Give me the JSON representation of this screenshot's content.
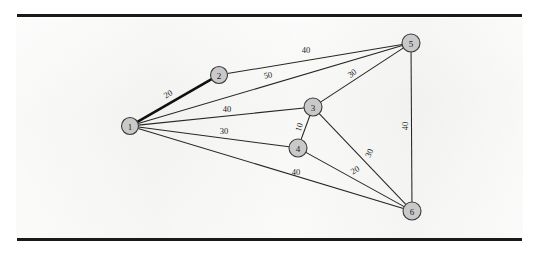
{
  "page": {
    "background_color": "#ffffff",
    "paper_color": "#f2f2f0",
    "rule_color": "#1a1a1a",
    "top_rule_label": "top-horizontal-rule",
    "bottom_rule_label": "bottom-horizontal-rule"
  },
  "figure": {
    "type": "weighted-undirected-graph",
    "node_fill": "#c9c9c9",
    "node_stroke": "#3a3a3a",
    "edge_color": "#262626",
    "highlight_edge_color": "#101010"
  },
  "chart_data": {
    "type": "diagram",
    "title": "",
    "nodes": [
      {
        "id": "1",
        "label": "1",
        "x": 130,
        "y": 126,
        "r": 8.5
      },
      {
        "id": "2",
        "label": "2",
        "x": 219,
        "y": 75,
        "r": 8.5
      },
      {
        "id": "3",
        "label": "3",
        "x": 313,
        "y": 107,
        "r": 9.0
      },
      {
        "id": "4",
        "label": "4",
        "x": 298,
        "y": 148,
        "r": 9.0
      },
      {
        "id": "5",
        "label": "5",
        "x": 411,
        "y": 43,
        "r": 9.0
      },
      {
        "id": "6",
        "label": "6",
        "x": 412,
        "y": 211,
        "r": 9.0
      }
    ],
    "edges": [
      {
        "from": "1",
        "to": "2",
        "weight": "20",
        "bold": true,
        "lx": 168,
        "ly": 94,
        "rot": -30
      },
      {
        "from": "1",
        "to": "5",
        "weight": "50",
        "bold": false,
        "lx": 268,
        "ly": 75,
        "rot": -12
      },
      {
        "from": "1",
        "to": "3",
        "weight": "40",
        "bold": false,
        "lx": 227,
        "ly": 109,
        "rot": 0
      },
      {
        "from": "1",
        "to": "4",
        "weight": "30",
        "bold": false,
        "lx": 224,
        "ly": 131,
        "rot": 0
      },
      {
        "from": "1",
        "to": "6",
        "weight": "40",
        "bold": false,
        "lx": 296,
        "ly": 172,
        "rot": 0
      },
      {
        "from": "2",
        "to": "5",
        "weight": "40",
        "bold": false,
        "lx": 306,
        "ly": 50,
        "rot": 0
      },
      {
        "from": "3",
        "to": "5",
        "weight": "30",
        "bold": false,
        "lx": 352,
        "ly": 73,
        "rot": -37
      },
      {
        "from": "3",
        "to": "4",
        "weight": "10",
        "bold": false,
        "lx": 299,
        "ly": 127,
        "rot": -72
      },
      {
        "from": "3",
        "to": "6",
        "weight": "30",
        "bold": false,
        "lx": 369,
        "ly": 153,
        "rot": -66
      },
      {
        "from": "4",
        "to": "6",
        "weight": "20",
        "bold": false,
        "lx": 355,
        "ly": 170,
        "rot": -30
      },
      {
        "from": "5",
        "to": "6",
        "weight": "40",
        "bold": false,
        "lx": 405,
        "ly": 126,
        "rot": -90
      }
    ],
    "node_count": 6,
    "edge_count": 11,
    "weights": [
      "20",
      "50",
      "40",
      "30",
      "40",
      "40",
      "30",
      "10",
      "30",
      "20",
      "40"
    ]
  }
}
